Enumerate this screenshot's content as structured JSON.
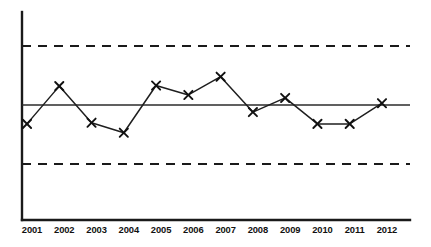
{
  "chart_data": {
    "type": "line",
    "title": "",
    "subtitle": "",
    "xlabel": "",
    "ylabel": "",
    "categories": [
      "2001",
      "2002",
      "2003",
      "2004",
      "2005",
      "2006",
      "2007",
      "2008",
      "2009",
      "2010",
      "2011",
      "2012"
    ],
    "series": [
      {
        "name": "observed",
        "values": [
          -0.32,
          0.32,
          -0.3,
          -0.47,
          0.33,
          0.17,
          0.48,
          -0.12,
          0.12,
          -0.32,
          -0.32,
          0.03
        ],
        "marker": "x",
        "color": "#111111"
      }
    ],
    "reference_lines": [
      {
        "name": "upper-control-limit",
        "value": 1,
        "style": "dashed",
        "color": "#1a1a1a"
      },
      {
        "name": "center-line",
        "value": 0,
        "style": "solid",
        "color": "#2b2b2b"
      },
      {
        "name": "lower-control-limit",
        "value": -1,
        "style": "dashed",
        "color": "#1a1a1a"
      }
    ],
    "ylim": [
      -1.75,
      1.55
    ],
    "xlim": [
      -0.55,
      11.95
    ],
    "grid": false,
    "legend": null,
    "legend_position": "none",
    "axes": {
      "y_axis_visible": true,
      "x_axis_visible": true,
      "y_ticks_visible": false,
      "x_ticks_visible": false
    }
  },
  "ticks": {
    "labels": [
      "2001",
      "2002",
      "2003",
      "2004",
      "2005",
      "2006",
      "2007",
      "2008",
      "2009",
      "2010",
      "2011",
      "2012"
    ]
  }
}
